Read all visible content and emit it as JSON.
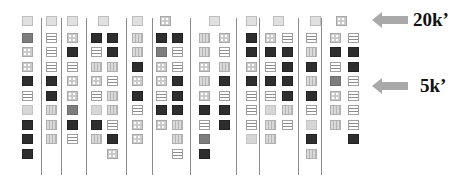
{
  "markers": [
    {
      "label": "20k’",
      "arrow_y": 20,
      "text_x": 413
    },
    {
      "label": "5k’",
      "arrow_y": 86,
      "text_x": 420
    }
  ],
  "lane_dividers_x": [
    41,
    61,
    86,
    126,
    152,
    190,
    236,
    259,
    298,
    321
  ],
  "top_squares": [
    {
      "x": 22,
      "p": "L"
    },
    {
      "x": 46,
      "p": "L"
    },
    {
      "x": 67,
      "p": "L"
    },
    {
      "x": 98,
      "p": "L"
    },
    {
      "x": 132,
      "p": "L"
    },
    {
      "x": 160,
      "p": "X"
    },
    {
      "x": 209,
      "p": "L"
    },
    {
      "x": 246,
      "p": "L"
    },
    {
      "x": 273,
      "p": "L"
    },
    {
      "x": 310,
      "p": "L"
    },
    {
      "x": 336,
      "p": "X"
    }
  ],
  "columns": [
    {
      "x": 22,
      "patterns": [
        "G",
        "X",
        "X",
        "D",
        "H",
        "P",
        "D",
        "D",
        "D"
      ]
    },
    {
      "x": 46,
      "patterns": [
        "H",
        "H",
        "H",
        "D",
        "D",
        "V",
        "V",
        "V"
      ]
    },
    {
      "x": 67,
      "patterns": [
        "X",
        "D",
        "H",
        "X",
        "X",
        "G",
        "D",
        "H"
      ]
    },
    {
      "x": 91,
      "patterns": [
        "D",
        "H",
        "V",
        "X",
        "H",
        "P",
        "D",
        "V"
      ]
    },
    {
      "x": 107,
      "patterns": [
        "D",
        "D",
        "V",
        "H",
        "V",
        "V",
        "H",
        "D",
        "X"
      ]
    },
    {
      "x": 132,
      "patterns": [
        "V",
        "V",
        "D",
        "X",
        "D",
        "H",
        "X",
        "X"
      ]
    },
    {
      "x": 156,
      "patterns": [
        "D",
        "G",
        "X",
        "X",
        "H",
        "D",
        "X"
      ]
    },
    {
      "x": 172,
      "patterns": [
        "D",
        "H",
        "H",
        "D",
        "D",
        "D",
        "V",
        "V",
        "H"
      ]
    },
    {
      "x": 199,
      "patterns": [
        "V",
        "V",
        "X",
        "V",
        "X",
        "D",
        "H",
        "G",
        "D"
      ]
    },
    {
      "x": 219,
      "patterns": [
        "X",
        "H",
        "V",
        "D",
        "H",
        "D",
        "D"
      ]
    },
    {
      "x": 246,
      "patterns": [
        "D",
        "D",
        "X",
        "D",
        "H",
        "H",
        "H",
        "P"
      ]
    },
    {
      "x": 265,
      "patterns": [
        "X",
        "D",
        "H",
        "D",
        "H",
        "P",
        "V",
        "V"
      ]
    },
    {
      "x": 282,
      "patterns": [
        "H",
        "D",
        "D",
        "D",
        "D",
        "V",
        "H"
      ]
    },
    {
      "x": 306,
      "patterns": [
        "H",
        "V",
        "D",
        "V",
        "D",
        "H",
        "P",
        "D",
        "V"
      ]
    },
    {
      "x": 330,
      "patterns": [
        "X",
        "D",
        "H",
        "G",
        "X",
        "V",
        "V"
      ]
    },
    {
      "x": 348,
      "patterns": [
        "H",
        "D",
        "D",
        "H",
        "H",
        "H",
        "H",
        "D"
      ]
    }
  ],
  "pattern_legend": {
    "P": "plain-light",
    "L": "light-box",
    "G": "medium-gray",
    "D": "dark",
    "H": "horizontal-stripes",
    "V": "vertical-stripes",
    "X": "dotted"
  }
}
